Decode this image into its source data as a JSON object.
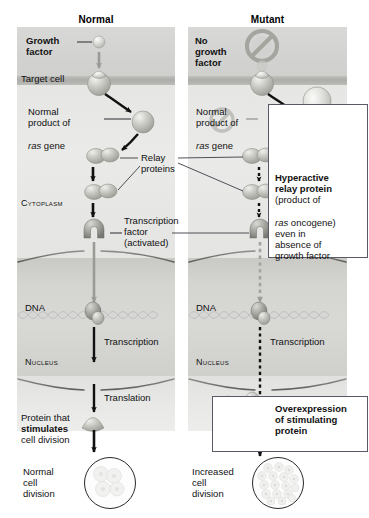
{
  "figure": {
    "domain": "Diagram",
    "topic": "Effects of mutations in the ras proto-oncogene on a cell-signaling pathway leading to cell division",
    "width": 369,
    "height": 518
  },
  "columns": {
    "normal": {
      "title": "Normal"
    },
    "mutant": {
      "title": "Mutant"
    }
  },
  "colors": {
    "extracellular": "#d4d4d2",
    "membrane": "#adadaa",
    "cytoplasm": "#e8e8e6",
    "nucleus": "#d4d4d1",
    "protein_fill": "#b6b6b2",
    "protein_highlight": "#e8e8e5",
    "arrow_dark": "#111111",
    "arrow_gray": "#9a9a97",
    "leader_line": "#3c3c46",
    "box_border": "#5a5a66",
    "dna_strand": "#b9b9c2",
    "text": "#111111"
  },
  "normal_panel": {
    "labels": {
      "growth_factor": "Growth\nfactor",
      "target_cell": "Target cell",
      "ras_product_line1": "Normal",
      "ras_product_line2": "product of",
      "ras_product_line3_italic": "ras",
      "ras_product_line3_rest": " gene",
      "cytoplasm": "Cytoplasm",
      "transcription_factor_line1": "Transcription",
      "transcription_factor_line2": "factor",
      "transcription_factor_line3": "(activated)",
      "dna": "DNA",
      "transcription": "Transcription",
      "nucleus": "Nucleus",
      "translation": "Translation",
      "stimulating_protein_line1": "Protein that",
      "stimulating_protein_line2_bold": "stimulates",
      "stimulating_protein_line3": "cell division",
      "outcome_line1": "Normal",
      "outcome_line2": "cell",
      "outcome_line3": "division"
    },
    "arrow_styles": {
      "growth_factor_to_receptor": "solid-gray",
      "receptor_to_ras": "solid-black",
      "ras_to_relay": "solid-black",
      "relay_chain": "solid-black",
      "relay_to_transcription_factor": "solid-black",
      "transcription_factor_to_dna": "solid-gray",
      "transcription": "solid-black",
      "translation": "solid-black",
      "protein_to_division": "solid-black"
    },
    "division_cells": 4
  },
  "mutant_panel": {
    "labels": {
      "no_growth_factor": "No\ngrowth\nfactor",
      "ras_product_line1": "Normal",
      "ras_product_line2": "product of",
      "ras_product_line3_italic": "ras",
      "ras_product_line3_rest": " gene",
      "dna": "DNA",
      "transcription": "Transcription",
      "nucleus": "Nucleus",
      "outcome_line1": "Increased",
      "outcome_line2": "cell",
      "outcome_line3": "division"
    },
    "arrow_styles": {
      "growth_factor_blocked": "prohibition-sign",
      "receptor_to_hyperactive": "solid-black",
      "hyperactive_to_relay": "dotted-black",
      "relay_chain": "dotted-black",
      "relay_to_transcription_factor": "dotted-black",
      "transcription_factor_to_dna": "dotted-gray",
      "transcription": "dotted-black",
      "to_division": "dotted-black"
    },
    "division_cells": 17
  },
  "shared_labels": {
    "relay_proteins_line1": "Relay",
    "relay_proteins_line2": "proteins"
  },
  "callouts": {
    "hyperactive": {
      "line1_bold": "Hyperactive",
      "line2_bold": "relay protein",
      "line3": "(product of",
      "line4_italic": "ras",
      "line4_rest": " oncogene)",
      "line5": "even in",
      "line6": "absence of",
      "line7": "growth factor"
    },
    "overexpression": {
      "line1_bold": "Overexpression",
      "line2_bold": "of stimulating",
      "line3_bold": "protein"
    }
  }
}
